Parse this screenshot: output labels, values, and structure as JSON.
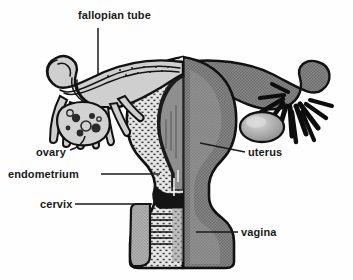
{
  "figure": {
    "background_color": "#fefefe",
    "ink_color": "#1a1a1a",
    "tones": {
      "outline": "#111111",
      "mid_gray": "#808080",
      "light_gray": "#b9b9b9",
      "dark_gray": "#555555",
      "stipple": "#6e6e6e",
      "highlight": "#d8d8d8"
    }
  },
  "labels": {
    "fallopian_tube": "fallopian tube",
    "ovary": "ovary",
    "endometrium": "endometrium",
    "cervix": "cervix",
    "uterus": "uterus",
    "vagina": "vagina"
  },
  "structures": [
    {
      "name": "fallopian-tube-left",
      "side": "left",
      "style": "striated-outline"
    },
    {
      "name": "fallopian-tube-right",
      "side": "right",
      "style": "solid-gray"
    },
    {
      "name": "fimbriae-left",
      "side": "left",
      "style": "outlined-fingers"
    },
    {
      "name": "fimbriae-right",
      "side": "right",
      "style": "solid-black-fingers"
    },
    {
      "name": "ovary-left",
      "side": "left",
      "style": "follicles-visible"
    },
    {
      "name": "ovary-right",
      "side": "right",
      "style": "plain-gray-oval"
    },
    {
      "name": "uterus-body",
      "side": "both",
      "style": "half-cutaway"
    },
    {
      "name": "myometrium",
      "side": "left",
      "style": "stippled"
    },
    {
      "name": "endometrium-lining",
      "side": "left",
      "style": "dark-band"
    },
    {
      "name": "uterine-cavity",
      "side": "left",
      "style": "gray-wedge"
    },
    {
      "name": "cervix",
      "side": "left",
      "style": "dark-band-with-rugae"
    },
    {
      "name": "vagina",
      "side": "both",
      "style": "gray-canal"
    }
  ]
}
